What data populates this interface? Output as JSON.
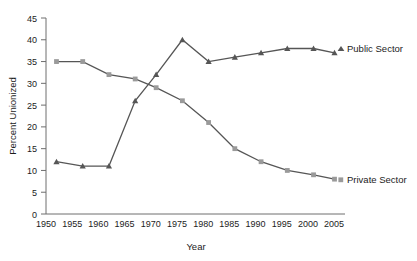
{
  "chart_data": {
    "type": "line",
    "title": "",
    "xlabel": "Year",
    "ylabel": "Percent Unionized",
    "xlim": [
      1950,
      2007
    ],
    "ylim": [
      0,
      45
    ],
    "ytick_step": 5,
    "xtick_step": 5,
    "grid": false,
    "legend_position": "right-inline",
    "xticks": [
      "1950",
      "1955",
      "1960",
      "1965",
      "1970",
      "1975",
      "1980",
      "1985",
      "1990",
      "1995",
      "2000",
      "2005"
    ],
    "yticks": [
      "0",
      "5",
      "10",
      "15",
      "20",
      "25",
      "30",
      "35",
      "40",
      "45"
    ],
    "x": [
      1952,
      1957,
      1962,
      1967,
      1971,
      1976,
      1981,
      1986,
      1991,
      1996,
      2001,
      2005
    ],
    "series": [
      {
        "name": "Public Sector",
        "color": "#565656",
        "marker": "triangle",
        "values": [
          12,
          11,
          11,
          26,
          32,
          40,
          35,
          36,
          37,
          38,
          38,
          37
        ]
      },
      {
        "name": "Private Sector",
        "color": "#9a9a9a",
        "marker": "square",
        "line_color": "#565656",
        "values": [
          35,
          35,
          32,
          31,
          29,
          26,
          21,
          15,
          12,
          10,
          9,
          8
        ]
      }
    ],
    "annotations": [
      {
        "text": "Public Sector",
        "series": "Public Sector"
      },
      {
        "text": "Private Sector",
        "series": "Private Sector"
      }
    ]
  },
  "colors": {
    "public_sector": "#565656",
    "private_sector_marker": "#9a9a9a",
    "axis": "#6e6e6e",
    "text": "#1c1c1c",
    "background": "#ffffff"
  }
}
